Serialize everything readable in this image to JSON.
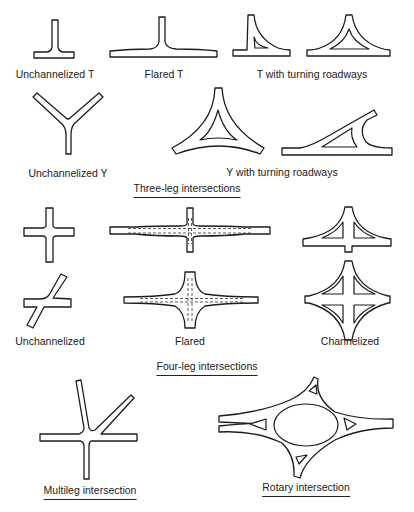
{
  "figure": {
    "sections": {
      "three_leg": {
        "title": "Three-leg intersections"
      },
      "four_leg": {
        "title": "Four-leg intersections"
      }
    },
    "three_leg_items": [
      {
        "label": "Unchannelized T"
      },
      {
        "label": "Flared T"
      },
      {
        "label": "T with turning roadways"
      },
      {
        "label": "Unchannelized Y"
      },
      {
        "label": "Y with turning roadways"
      }
    ],
    "four_leg_items": [
      {
        "label": "Unchannelized"
      },
      {
        "label": "Flared"
      },
      {
        "label": "Channelized"
      }
    ],
    "other_items": [
      {
        "label": "Multileg intersection"
      },
      {
        "label": "Rotary intersection"
      }
    ],
    "colors": {
      "line": "#1c1c1c",
      "background": "#ffffff"
    }
  }
}
